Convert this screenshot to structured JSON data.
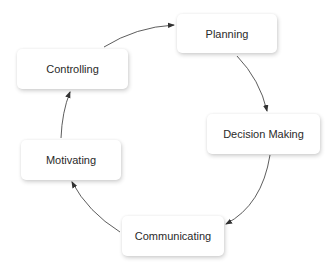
{
  "diagram": {
    "type": "cycle",
    "nodes": [
      {
        "id": "planning",
        "label": "Planning"
      },
      {
        "id": "decision_making",
        "label": "Decision Making"
      },
      {
        "id": "communicating",
        "label": "Communicating"
      },
      {
        "id": "motivating",
        "label": "Motivating"
      },
      {
        "id": "controlling",
        "label": "Controlling"
      }
    ],
    "edges": [
      {
        "from": "planning",
        "to": "decision_making"
      },
      {
        "from": "decision_making",
        "to": "communicating"
      },
      {
        "from": "communicating",
        "to": "motivating"
      },
      {
        "from": "motivating",
        "to": "controlling"
      },
      {
        "from": "controlling",
        "to": "planning"
      }
    ],
    "colors": {
      "node_fill": "#ffffff",
      "text": "#2a2a2a",
      "arrow": "#333333",
      "background": "#ffffff"
    }
  }
}
